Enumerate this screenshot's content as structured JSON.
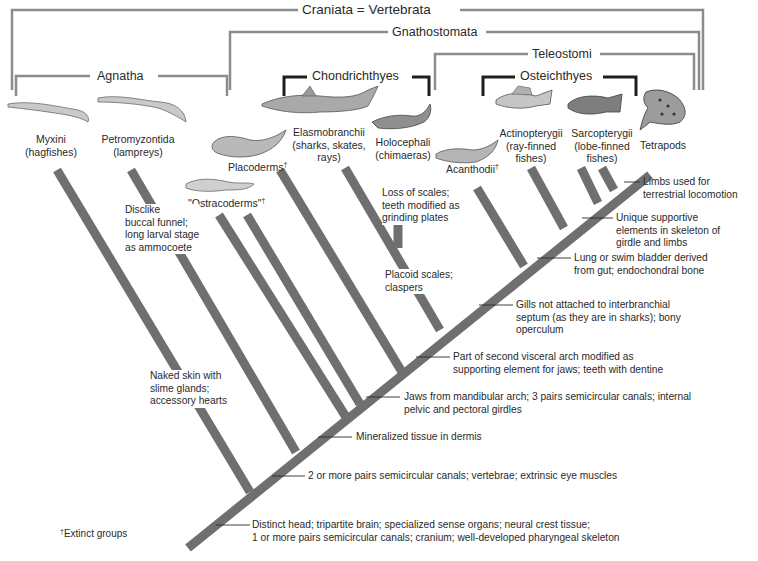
{
  "colors": {
    "branch": "#6f6f6f",
    "bracket_gray": "#8c8c8c",
    "bracket_dark": "#1e1e1e",
    "text": "#2a2a2a",
    "background": "#ffffff"
  },
  "groups": {
    "craniata": "Craniata = Vertebrata",
    "gnathostomata": "Gnathostomata",
    "teleostomi": "Teleostomi",
    "agnatha": "Agnatha",
    "chondrichthyes": "Chondrichthyes",
    "osteichthyes": "Osteichthyes"
  },
  "taxa": [
    {
      "name": "Myxini",
      "common": "(hagfishes)",
      "extinct": false,
      "icon": "hagfish-illustration"
    },
    {
      "name": "Petromyzontida",
      "common": "(lampreys)",
      "extinct": false,
      "icon": "lamprey-illustration"
    },
    {
      "name": "\"Ostracoderms\"",
      "common": "",
      "extinct": true,
      "icon": "ostracoderm-illustration"
    },
    {
      "name": "Placoderms",
      "common": "",
      "extinct": true,
      "icon": "placoderm-illustration"
    },
    {
      "name": "Elasmobranchii",
      "common": "(sharks, skates,",
      "common2": "rays)",
      "extinct": false,
      "icon": "shark-illustration"
    },
    {
      "name": "Holocephali",
      "common": "(chimaeras)",
      "extinct": false,
      "icon": "chimaera-illustration"
    },
    {
      "name": "Acanthodii",
      "common": "",
      "extinct": true,
      "icon": "acanthodian-illustration"
    },
    {
      "name": "Actinopterygii",
      "common": "(ray-finned",
      "common2": "fishes)",
      "extinct": false,
      "icon": "perch-illustration"
    },
    {
      "name": "Sarcopterygii",
      "common": "(lobe-finned",
      "common2": "fishes)",
      "extinct": false,
      "icon": "coelacanth-illustration"
    },
    {
      "name": "Tetrapods",
      "common": "",
      "extinct": false,
      "icon": "frog-illustration"
    }
  ],
  "dagger": "†",
  "characters": [
    {
      "id": "head",
      "lines": [
        "Distinct head; tripartite brain; specialized sense organs; neural crest tissue;",
        "1 or more pairs semicircular canals; cranium; well-developed pharyngeal skeleton"
      ]
    },
    {
      "id": "vertebrae",
      "lines": [
        "2 or more pairs semicircular canals; vertebrae; extrinsic eye muscles"
      ]
    },
    {
      "id": "mineralized",
      "lines": [
        "Mineralized tissue in dermis"
      ]
    },
    {
      "id": "jaws",
      "lines": [
        "Jaws from mandibular arch; 3 pairs semicircular canals; internal",
        "pelvic and pectoral girdles"
      ]
    },
    {
      "id": "visceral-arch",
      "lines": [
        "Part of second visceral arch modified as",
        "supporting element for jaws; teeth with dentine"
      ]
    },
    {
      "id": "gills",
      "lines": [
        "Gills not attached to interbranchial",
        "septum (as they are in sharks); bony",
        "operculum"
      ]
    },
    {
      "id": "lung",
      "lines": [
        "Lung or swim bladder derived",
        "from gut; endochondral bone"
      ]
    },
    {
      "id": "supportive",
      "lines": [
        "Unique supportive",
        "elements in skeleton of",
        "girdle and limbs"
      ]
    },
    {
      "id": "limbs",
      "lines": [
        "Limbs used for",
        "terrestrial locomotion"
      ]
    },
    {
      "id": "hagfish",
      "lines": [
        "Naked skin with",
        "slime glands;",
        "accessory hearts"
      ]
    },
    {
      "id": "lamprey",
      "lines": [
        "Disclike",
        "buccal funnel;",
        "long larval stage",
        "as ammocoete"
      ]
    },
    {
      "id": "placoid",
      "lines": [
        "Placoid scales;",
        "claspers"
      ]
    },
    {
      "id": "holocephali",
      "lines": [
        "Loss of scales;",
        "teeth modified as",
        "grinding plates"
      ]
    }
  ],
  "footnote": {
    "dagger": "†",
    "text": "Extinct groups"
  }
}
